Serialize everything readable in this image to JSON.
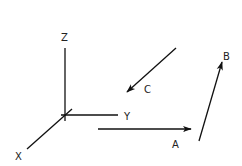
{
  "diagram": {
    "type": "3d-axes-with-vectors",
    "colors": {
      "line": "#111111",
      "text": "#222222",
      "background": "#ffffff"
    },
    "axes": {
      "z": {
        "label": "Z"
      },
      "y": {
        "label": "Y"
      },
      "x": {
        "label": "X"
      }
    },
    "vectors": {
      "a": {
        "label": "A"
      },
      "b": {
        "label": "B"
      },
      "c": {
        "label": "C"
      }
    }
  }
}
